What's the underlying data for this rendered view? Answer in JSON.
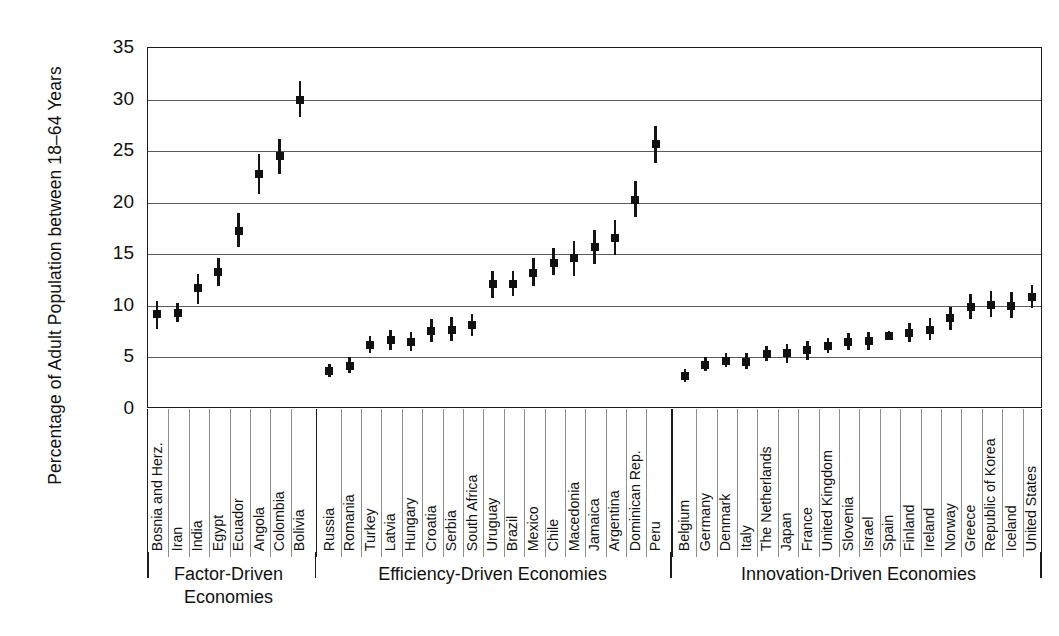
{
  "axis": {
    "y_title": "Percentage of Adult Population between 18–64 Years",
    "y_ticks": [
      "0",
      "5",
      "10",
      "15",
      "20",
      "25",
      "30",
      "35"
    ]
  },
  "groups": [
    {
      "name": "factor",
      "label": "Factor-Driven\nEconomies"
    },
    {
      "name": "efficiency",
      "label": "Efficiency-Driven Economies"
    },
    {
      "name": "innovation",
      "label": "Innovation-Driven Economies"
    }
  ],
  "chart_data": {
    "type": "scatter",
    "title": "",
    "xlabel": "",
    "ylabel": "Percentage of Adult Population between 18–64 Years",
    "ylim": [
      0,
      35
    ],
    "yticks": [
      0,
      5,
      10,
      15,
      20,
      25,
      30,
      35
    ],
    "grid": true,
    "legend": "none",
    "marker": "point with 95% confidence interval whiskers",
    "groups": [
      "Factor-Driven Economies",
      "Efficiency-Driven Economies",
      "Innovation-Driven Economies"
    ],
    "categories": [
      "Bosnia and Herz.",
      "Iran",
      "India",
      "Egypt",
      "Ecuador",
      "Angola",
      "Colombia",
      "Bolivia",
      "Russia",
      "Romania",
      "Turkey",
      "Latvia",
      "Hungary",
      "Croatia",
      "Serbia",
      "South Africa",
      "Uruguay",
      "Brazil",
      "Mexico",
      "Chile",
      "Macedonia",
      "Jamaica",
      "Argentina",
      "Dominican Rep.",
      "Peru",
      "Belgium",
      "Germany",
      "Denmark",
      "Italy",
      "The Netherlands",
      "Japan",
      "France",
      "United Kingdom",
      "Slovenia",
      "Israel",
      "Spain",
      "Finland",
      "Ireland",
      "Norway",
      "Greece",
      "Republic of Korea",
      "Iceland",
      "United States"
    ],
    "points": [
      {
        "category": "Bosnia and Herz.",
        "group": "Factor-Driven Economies",
        "value": 9.1,
        "low": 7.7,
        "high": 10.4
      },
      {
        "category": "Iran",
        "group": "Factor-Driven Economies",
        "value": 9.2,
        "low": 8.3,
        "high": 10.2
      },
      {
        "category": "India",
        "group": "Factor-Driven Economies",
        "value": 11.6,
        "low": 10.1,
        "high": 13.0
      },
      {
        "category": "Egypt",
        "group": "Factor-Driven Economies",
        "value": 13.2,
        "low": 11.8,
        "high": 14.5
      },
      {
        "category": "Ecuador",
        "group": "Factor-Driven Economies",
        "value": 17.2,
        "low": 15.6,
        "high": 18.9
      },
      {
        "category": "Angola",
        "group": "Factor-Driven Economies",
        "value": 22.7,
        "low": 20.7,
        "high": 24.6
      },
      {
        "category": "Colombia",
        "group": "Factor-Driven Economies",
        "value": 24.4,
        "low": 22.7,
        "high": 26.1
      },
      {
        "category": "Bolivia",
        "group": "Factor-Driven Economies",
        "value": 29.9,
        "low": 28.2,
        "high": 31.7
      },
      {
        "category": "Russia",
        "group": "Efficiency-Driven Economies",
        "value": 3.6,
        "low": 3.0,
        "high": 4.3
      },
      {
        "category": "Romania",
        "group": "Efficiency-Driven Economies",
        "value": 4.1,
        "low": 3.4,
        "high": 4.9
      },
      {
        "category": "Turkey",
        "group": "Efficiency-Driven Economies",
        "value": 6.1,
        "low": 5.3,
        "high": 7.0
      },
      {
        "category": "Latvia",
        "group": "Efficiency-Driven Economies",
        "value": 6.6,
        "low": 5.6,
        "high": 7.6
      },
      {
        "category": "Hungary",
        "group": "Efficiency-Driven Economies",
        "value": 6.4,
        "low": 5.5,
        "high": 7.4
      },
      {
        "category": "Croatia",
        "group": "Efficiency-Driven Economies",
        "value": 7.5,
        "low": 6.4,
        "high": 8.6
      },
      {
        "category": "Serbia",
        "group": "Efficiency-Driven Economies",
        "value": 7.6,
        "low": 6.5,
        "high": 8.8
      },
      {
        "category": "South Africa",
        "group": "Efficiency-Driven Economies",
        "value": 8.0,
        "low": 7.0,
        "high": 9.1
      },
      {
        "category": "Uruguay",
        "group": "Efficiency-Driven Economies",
        "value": 12.0,
        "low": 10.7,
        "high": 13.3
      },
      {
        "category": "Brazil",
        "group": "Efficiency-Driven Economies",
        "value": 12.0,
        "low": 10.9,
        "high": 13.3
      },
      {
        "category": "Mexico",
        "group": "Efficiency-Driven Economies",
        "value": 13.1,
        "low": 11.8,
        "high": 14.5
      },
      {
        "category": "Chile",
        "group": "Efficiency-Driven Economies",
        "value": 14.1,
        "low": 12.9,
        "high": 15.5
      },
      {
        "category": "Macedonia",
        "group": "Efficiency-Driven Economies",
        "value": 14.5,
        "low": 12.8,
        "high": 16.2
      },
      {
        "category": "Jamaica",
        "group": "Efficiency-Driven Economies",
        "value": 15.6,
        "low": 14.0,
        "high": 17.3
      },
      {
        "category": "Argentina",
        "group": "Efficiency-Driven Economies",
        "value": 16.5,
        "low": 14.8,
        "high": 18.2
      },
      {
        "category": "Dominican Rep.",
        "group": "Efficiency-Driven Economies",
        "value": 20.2,
        "low": 18.5,
        "high": 22.0
      },
      {
        "category": "Peru",
        "group": "Efficiency-Driven Economies",
        "value": 25.6,
        "low": 23.8,
        "high": 27.3
      },
      {
        "category": "Belgium",
        "group": "Innovation-Driven Economies",
        "value": 3.1,
        "low": 2.5,
        "high": 3.8
      },
      {
        "category": "Germany",
        "group": "Innovation-Driven Economies",
        "value": 4.2,
        "low": 3.6,
        "high": 4.9
      },
      {
        "category": "Denmark",
        "group": "Innovation-Driven Economies",
        "value": 4.6,
        "low": 4.0,
        "high": 5.3
      },
      {
        "category": "Italy",
        "group": "Innovation-Driven Economies",
        "value": 4.5,
        "low": 3.8,
        "high": 5.3
      },
      {
        "category": "The Netherlands",
        "group": "Innovation-Driven Economies",
        "value": 5.2,
        "low": 4.6,
        "high": 6.0
      },
      {
        "category": "Japan",
        "group": "Innovation-Driven Economies",
        "value": 5.3,
        "low": 4.4,
        "high": 6.2
      },
      {
        "category": "France",
        "group": "Innovation-Driven Economies",
        "value": 5.6,
        "low": 4.7,
        "high": 6.5
      },
      {
        "category": "United Kingdom",
        "group": "Innovation-Driven Economies",
        "value": 6.0,
        "low": 5.3,
        "high": 6.8
      },
      {
        "category": "Slovenia",
        "group": "Innovation-Driven Economies",
        "value": 6.4,
        "low": 5.6,
        "high": 7.3
      },
      {
        "category": "Israel",
        "group": "Innovation-Driven Economies",
        "value": 6.5,
        "low": 5.6,
        "high": 7.4
      },
      {
        "category": "Spain",
        "group": "Innovation-Driven Economies",
        "value": 7.0,
        "low": 6.6,
        "high": 7.5
      },
      {
        "category": "Finland",
        "group": "Innovation-Driven Economies",
        "value": 7.3,
        "low": 6.4,
        "high": 8.2
      },
      {
        "category": "Ireland",
        "group": "Innovation-Driven Economies",
        "value": 7.6,
        "low": 6.6,
        "high": 8.7
      },
      {
        "category": "Norway",
        "group": "Innovation-Driven Economies",
        "value": 8.7,
        "low": 7.6,
        "high": 9.8
      },
      {
        "category": "Greece",
        "group": "Innovation-Driven Economies",
        "value": 9.8,
        "low": 8.6,
        "high": 11.1
      },
      {
        "category": "Republic of Korea",
        "group": "Innovation-Driven Economies",
        "value": 10.0,
        "low": 8.8,
        "high": 11.3
      },
      {
        "category": "Iceland",
        "group": "Innovation-Driven Economies",
        "value": 9.9,
        "low": 8.7,
        "high": 11.2
      },
      {
        "category": "United States",
        "group": "Innovation-Driven Economies",
        "value": 10.8,
        "low": 9.7,
        "high": 11.9
      }
    ]
  }
}
